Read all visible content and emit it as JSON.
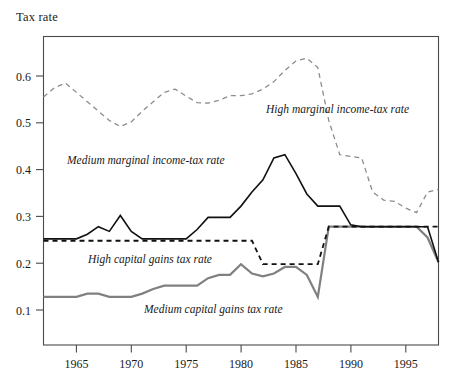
{
  "axis_title": "Tax rate",
  "colors": {
    "high_marginal": "#8c8c8c",
    "medium_marginal": "#111111",
    "high_capital_gains": "#111111",
    "medium_capital_gains": "#808080",
    "axis": "#4a4a4a",
    "background": "#ffffff"
  },
  "labels": {
    "high_marginal": "High marginal income-tax rate",
    "medium_marginal": "Medium marginal income-tax rate",
    "high_capital_gains": "High capital gains tax rate",
    "medium_capital_gains": "Medium capital gains tax rate"
  },
  "ticks": {
    "y": [
      "0.6",
      "0.5",
      "0.4",
      "0.3",
      "0.2",
      "0.1"
    ],
    "x": [
      "1965",
      "1970",
      "1975",
      "1980",
      "1985",
      "1990",
      "1995"
    ]
  },
  "chart_data": {
    "type": "line",
    "title": "",
    "subtitle": "",
    "xlabel": "",
    "ylabel": "Tax rate",
    "xlim": [
      1962,
      1998
    ],
    "ylim": [
      0.05,
      0.68
    ],
    "yticks": [
      0.1,
      0.2,
      0.3,
      0.4,
      0.5,
      0.6
    ],
    "xticks": [
      1965,
      1970,
      1975,
      1980,
      1985,
      1990,
      1995
    ],
    "grid": false,
    "legend": "inline-annotations",
    "x": [
      1962,
      1963,
      1964,
      1965,
      1966,
      1967,
      1968,
      1969,
      1970,
      1971,
      1972,
      1973,
      1974,
      1975,
      1976,
      1977,
      1978,
      1979,
      1980,
      1981,
      1982,
      1983,
      1984,
      1985,
      1986,
      1987,
      1988,
      1989,
      1990,
      1991,
      1992,
      1993,
      1994,
      1995,
      1996,
      1997,
      1998
    ],
    "series": [
      {
        "name": "High marginal income-tax rate",
        "style": "dashed",
        "color": "#8c8c8c",
        "values": [
          0.555,
          0.575,
          0.585,
          0.565,
          0.545,
          0.525,
          0.505,
          0.492,
          0.502,
          0.525,
          0.545,
          0.565,
          0.572,
          0.557,
          0.543,
          0.542,
          0.548,
          0.558,
          0.558,
          0.562,
          0.572,
          0.588,
          0.612,
          0.632,
          0.638,
          0.618,
          0.505,
          0.432,
          0.428,
          0.425,
          0.352,
          0.335,
          0.332,
          0.318,
          0.308,
          0.352,
          0.358
        ],
        "values_note": "values continue flat at 0.358 to 1998"
      },
      {
        "name": "Medium marginal income-tax rate",
        "style": "solid",
        "color": "#111111",
        "values": [
          0.252,
          0.252,
          0.252,
          0.252,
          0.262,
          0.278,
          0.268,
          0.302,
          0.268,
          0.252,
          0.252,
          0.252,
          0.252,
          0.252,
          0.272,
          0.298,
          0.298,
          0.298,
          0.322,
          0.352,
          0.378,
          0.425,
          0.432,
          0.392,
          0.348,
          0.322,
          0.322,
          0.322,
          0.282,
          0.278,
          0.278,
          0.278,
          0.278,
          0.278,
          0.278,
          0.278,
          0.202
        ],
        "values_note": "drop near 1997 to about 0.20"
      },
      {
        "name": "High capital gains tax rate",
        "style": "dashed",
        "color": "#111111",
        "values": [
          0.248,
          0.248,
          0.248,
          0.248,
          0.248,
          0.248,
          0.248,
          0.248,
          0.248,
          0.248,
          0.248,
          0.248,
          0.248,
          0.248,
          0.248,
          0.248,
          0.248,
          0.248,
          0.248,
          0.248,
          0.198,
          0.198,
          0.198,
          0.198,
          0.198,
          0.198,
          0.278,
          0.278,
          0.278,
          0.278,
          0.278,
          0.278,
          0.278,
          0.278,
          0.278,
          0.278,
          0.278
        ],
        "values_note": "steps down at 1982, jumps to 0.28 at 1987"
      },
      {
        "name": "Medium capital gains tax rate",
        "style": "solid",
        "color": "#808080",
        "values": [
          0.128,
          0.128,
          0.128,
          0.128,
          0.135,
          0.135,
          0.128,
          0.128,
          0.128,
          0.135,
          0.145,
          0.152,
          0.152,
          0.152,
          0.152,
          0.168,
          0.175,
          0.175,
          0.198,
          0.178,
          0.172,
          0.178,
          0.192,
          0.192,
          0.175,
          0.128,
          0.278,
          0.278,
          0.278,
          0.278,
          0.278,
          0.278,
          0.278,
          0.278,
          0.278,
          0.255,
          0.202
        ],
        "values_note": "jumps to 0.28 at 1987, declines at the end"
      }
    ]
  }
}
